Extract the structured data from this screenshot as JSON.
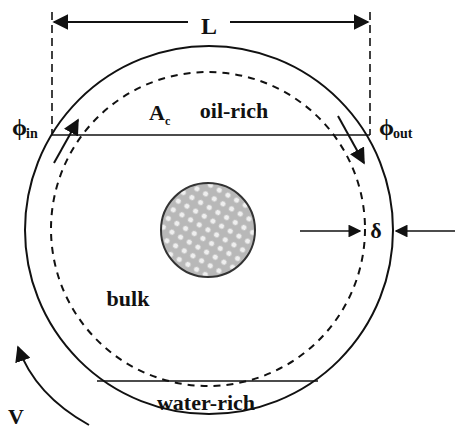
{
  "diagram": {
    "labels": {
      "length": "L",
      "phi_in": "ϕ",
      "phi_in_sub": "in",
      "phi_out": "ϕ",
      "phi_out_sub": "out",
      "area": "A",
      "area_sub": "c",
      "oil_region": "oil-rich",
      "bulk_region": "bulk",
      "water_region": "water-rich",
      "film_thickness": "δ",
      "velocity": "V"
    },
    "colors": {
      "stroke": "#111111",
      "particle_fill": "#b8b8b8",
      "particle_dot": "#ececec",
      "background": "#ffffff"
    },
    "geometry": {
      "outer_circle": {
        "cx": 209,
        "cy": 230,
        "r": 184
      },
      "dashed_circle": {
        "cx": 208,
        "cy": 229,
        "r": 157
      },
      "inner_particle": {
        "cx": 208,
        "cy": 230,
        "r": 47
      }
    }
  }
}
